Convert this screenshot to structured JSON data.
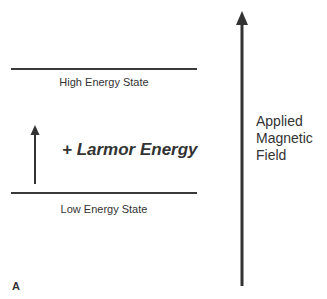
{
  "diagram": {
    "high_state_label": "High Energy State",
    "low_state_label": "Low Energy State",
    "transition_label": "+ Larmor Energy",
    "field_label_lines": [
      "Applied",
      "Magnetic",
      "Field"
    ],
    "panel_letter": "A",
    "colors": {
      "line": "#3a3a3a",
      "text": "#333333",
      "background": "#ffffff"
    }
  }
}
